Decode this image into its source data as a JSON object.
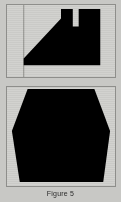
{
  "figure": {
    "caption": "Figure 5",
    "background_color": "#c8c8c5",
    "panel_fill": "#d2d2cf",
    "panel_border": "#8e8e8b",
    "shape_color": "#000000",
    "panels": [
      {
        "name": "top-panel",
        "shape_name": "notched-wedge-silhouette",
        "description": "Black polygon with long diagonal from lower-left rising to upper-middle, a rectangular V notch at the top center, flat top segments and a small step at the lower left",
        "viewbox": "0 0 110 74",
        "points": "17 62 17 55 55 14 55 4 67 4 67 22 73 22 73 4 95 4 95 62",
        "guide_line": {
          "name": "left-vertical-guide",
          "x": 17,
          "y1": 0,
          "y2": 74,
          "color": "#9b9b98"
        }
      },
      {
        "name": "bottom-panel",
        "shape_name": "hexagon-silhouette",
        "description": "Large black hexagon with flat wide top edge, angled upper sides, left and right vertices near mid height, and a flat narrower bottom edge",
        "viewbox": "0 0 110 101",
        "points": "21 2 89 2 105 45 98 97 13 97 5 45"
      }
    ]
  }
}
